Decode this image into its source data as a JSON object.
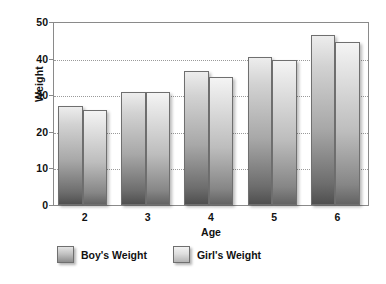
{
  "chart_data": {
    "type": "bar",
    "title": "",
    "xlabel": "Age",
    "ylabel": "Weight",
    "categories": [
      "2",
      "3",
      "4",
      "5",
      "6"
    ],
    "series": [
      {
        "name": "Boy's  Weight",
        "values": [
          27,
          31,
          36.5,
          40.5,
          46.5
        ]
      },
      {
        "name": "Girl's Weight",
        "values": [
          26,
          31,
          35,
          39.5,
          44.5
        ]
      }
    ],
    "ylim": [
      0,
      50
    ],
    "ytick_values": [
      0,
      10,
      20,
      30,
      40,
      50
    ],
    "ytick_labels": [
      "0",
      "10",
      "20",
      "30",
      "40",
      "50"
    ],
    "grid": "horizontal-dotted",
    "legend_position": "bottom-left",
    "colors": {
      "boy_top": "#ededed",
      "boy_bottom": "#4f4f4f",
      "girl_top": "#f4f4f4",
      "girl_bottom": "#636363",
      "axis": "#8a8a8a",
      "grid": "#9a9a9a",
      "text": "#111111",
      "background": "#ffffff"
    }
  },
  "legend": {
    "items": [
      {
        "label": "Boy's  Weight"
      },
      {
        "label": "Girl's Weight"
      }
    ]
  },
  "axes": {
    "y_title": "Weight",
    "x_title": "Age"
  }
}
